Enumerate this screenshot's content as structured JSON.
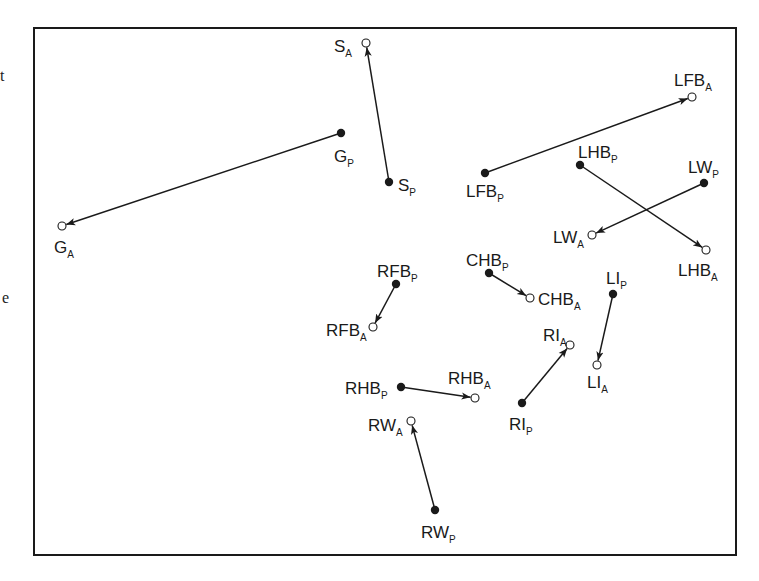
{
  "colors": {
    "ink": "#1a1a1a",
    "background": "#ffffff"
  },
  "frame": {
    "x": 34,
    "y": 28,
    "width": 702,
    "height": 527
  },
  "margin_fragments": [
    {
      "text": "t",
      "x": 0,
      "y": 67
    },
    {
      "text": "e",
      "x": 2,
      "y": 289
    }
  ],
  "legend": {
    "filled_dot": "P (initial position)",
    "open_dot": "A (final position)"
  },
  "vectors": [
    {
      "id": "S",
      "from": {
        "base": "S",
        "sub": "P",
        "x": 389,
        "y": 182,
        "lx": 398,
        "ly": 191
      },
      "to": {
        "base": "S",
        "sub": "A",
        "x": 366,
        "y": 43,
        "lx": 334,
        "ly": 52
      }
    },
    {
      "id": "G",
      "from": {
        "base": "G",
        "sub": "P",
        "x": 341,
        "y": 133,
        "lx": 334,
        "ly": 162
      },
      "to": {
        "base": "G",
        "sub": "A",
        "x": 62,
        "y": 226,
        "lx": 54,
        "ly": 253
      }
    },
    {
      "id": "LFB",
      "from": {
        "base": "LFB",
        "sub": "P",
        "x": 485,
        "y": 173,
        "lx": 466,
        "ly": 197
      },
      "to": {
        "base": "LFB",
        "sub": "A",
        "x": 692,
        "y": 97,
        "lx": 674,
        "ly": 86
      }
    },
    {
      "id": "LHB",
      "from": {
        "base": "LHB",
        "sub": "P",
        "x": 580,
        "y": 165,
        "lx": 578,
        "ly": 158
      },
      "to": {
        "base": "LHB",
        "sub": "A",
        "x": 706,
        "y": 250,
        "lx": 678,
        "ly": 276
      }
    },
    {
      "id": "LW",
      "from": {
        "base": "LW",
        "sub": "P",
        "x": 704,
        "y": 183,
        "lx": 688,
        "ly": 173
      },
      "to": {
        "base": "LW",
        "sub": "A",
        "x": 592,
        "y": 235,
        "lx": 553,
        "ly": 243
      }
    },
    {
      "id": "RFB",
      "from": {
        "base": "RFB",
        "sub": "P",
        "x": 396,
        "y": 284,
        "lx": 377,
        "ly": 277
      },
      "to": {
        "base": "RFB",
        "sub": "A",
        "x": 373,
        "y": 327,
        "lx": 326,
        "ly": 336
      }
    },
    {
      "id": "CHB",
      "from": {
        "base": "CHB",
        "sub": "P",
        "x": 489,
        "y": 273,
        "lx": 466,
        "ly": 266
      },
      "to": {
        "base": "CHB",
        "sub": "A",
        "x": 530,
        "y": 298,
        "lx": 538,
        "ly": 305
      }
    },
    {
      "id": "LI",
      "from": {
        "base": "LI",
        "sub": "P",
        "x": 613,
        "y": 294,
        "lx": 606,
        "ly": 284
      },
      "to": {
        "base": "LI",
        "sub": "A",
        "x": 597,
        "y": 365,
        "lx": 587,
        "ly": 388
      }
    },
    {
      "id": "RI",
      "from": {
        "base": "RI",
        "sub": "P",
        "x": 522,
        "y": 403,
        "lx": 509,
        "ly": 430
      },
      "to": {
        "base": "RI",
        "sub": "A",
        "x": 570,
        "y": 345,
        "lx": 543,
        "ly": 341
      }
    },
    {
      "id": "RHB",
      "from": {
        "base": "RHB",
        "sub": "P",
        "x": 401,
        "y": 387,
        "lx": 345,
        "ly": 394
      },
      "to": {
        "base": "RHB",
        "sub": "A",
        "x": 475,
        "y": 398,
        "lx": 448,
        "ly": 384
      }
    },
    {
      "id": "RW",
      "from": {
        "base": "RW",
        "sub": "P",
        "x": 435,
        "y": 510,
        "lx": 421,
        "ly": 538
      },
      "to": {
        "base": "RW",
        "sub": "A",
        "x": 411,
        "y": 421,
        "lx": 368,
        "ly": 431
      }
    }
  ]
}
